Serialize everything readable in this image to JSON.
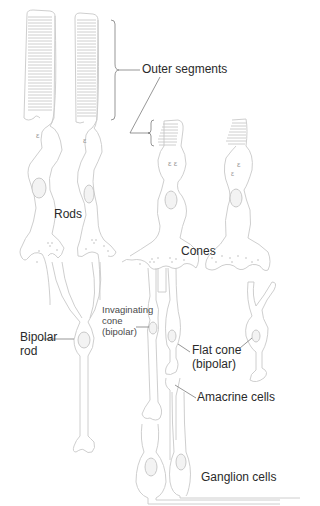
{
  "figure": {
    "labels": {
      "outer_segments": "Outer segments",
      "rods": "Rods",
      "cones": "Cones",
      "bipolar_rod_line1": "Bipolar",
      "bipolar_rod_line2": "rod",
      "invaginating_line1": "Invaginating",
      "invaginating_line2": "cone",
      "invaginating_line3": "(bipolar)",
      "flat_cone_line1": "Flat cone",
      "flat_cone_line2": "(bipolar)",
      "amacrine": "Amacrine cells",
      "ganglion": "Ganglion cells"
    },
    "colors": {
      "cell_outline": "#c8c8c8",
      "label_text": "#2a2a2a",
      "leader_line": "#6a6a6a",
      "background": "#ffffff"
    }
  }
}
